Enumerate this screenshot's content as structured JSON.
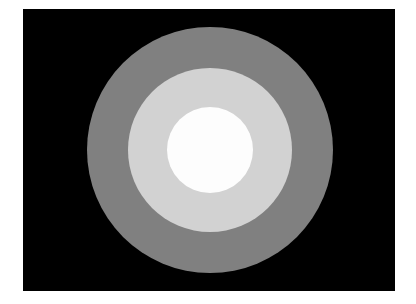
{
  "image": {
    "description": "Concentric circles on black background",
    "background_color": "#000000",
    "page_color": "#ffffff",
    "rings": [
      {
        "name": "outer",
        "color": "#808080",
        "radius_px": 123
      },
      {
        "name": "middle",
        "color": "#d2d2d2",
        "radius_px": 82
      },
      {
        "name": "inner",
        "color": "#fdfdfd",
        "radius_px": 43
      }
    ]
  }
}
